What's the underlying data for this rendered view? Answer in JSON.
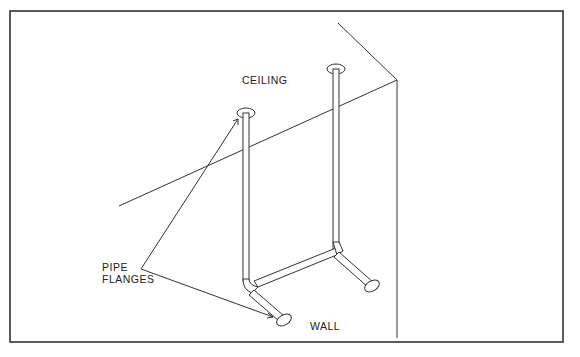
{
  "diagram": {
    "labels": {
      "ceiling": "CEILING",
      "pipe_flanges_line1": "PIPE",
      "pipe_flanges_line2": "FLANGES",
      "wall": "WALL"
    },
    "colors": {
      "ink": "#222222",
      "background": "#ffffff"
    }
  }
}
